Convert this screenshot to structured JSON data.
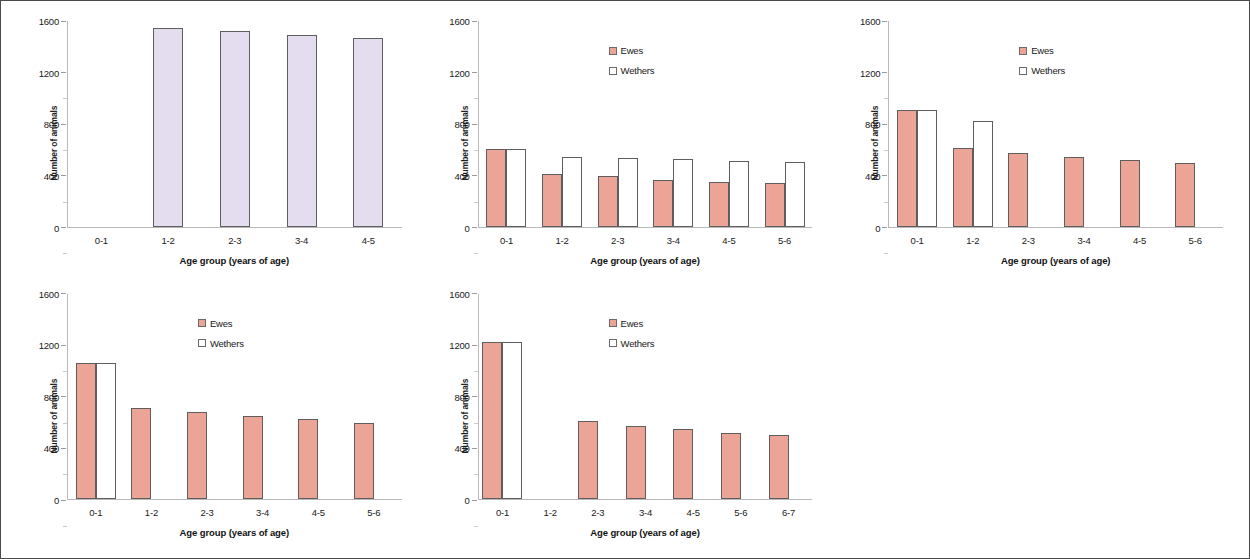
{
  "figure": {
    "panel_count": 5,
    "border_color": "#4a4a4a",
    "background": "#ffffff"
  },
  "colors": {
    "ewes_fill": "#eba496",
    "wethers_fill": "#ffffff",
    "lavender_fill": "#e4ddef",
    "bar_border": "#5e5e5e",
    "axis": "#b9b9b9"
  },
  "labels": {
    "ylabel": "Number of animals",
    "xlabel": "Age group (years of age)",
    "legend_ewes": "Ewes",
    "legend_wethers": "Wethers",
    "yticks": [
      "0",
      "400",
      "800",
      "1200",
      "1600"
    ]
  },
  "chart_data": [
    {
      "type": "bar",
      "panel": 1,
      "title": "",
      "xlabel": "Age group (years of age)",
      "ylabel": "Number of animals",
      "ylim": [
        0,
        1600
      ],
      "ytick_values": [
        0,
        400,
        800,
        1200,
        1600
      ],
      "grid": false,
      "legend": false,
      "categories": [
        "0-1",
        "1-2",
        "2-3",
        "3-4",
        "4-5"
      ],
      "series": [
        {
          "name": "Animals",
          "color": "#e4ddef",
          "values": [
            0,
            1545,
            1520,
            1495,
            1465
          ]
        }
      ]
    },
    {
      "type": "bar",
      "panel": 2,
      "title": "",
      "xlabel": "Age group (years of age)",
      "ylabel": "Number of animals",
      "ylim": [
        0,
        1600
      ],
      "ytick_values": [
        0,
        400,
        800,
        1200,
        1600
      ],
      "grid": false,
      "legend": true,
      "legend_position": "upper-center",
      "categories": [
        "0-1",
        "1-2",
        "2-3",
        "3-4",
        "4-5",
        "5-6"
      ],
      "series": [
        {
          "name": "Ewes",
          "color": "#eba496",
          "values": [
            605,
            410,
            390,
            365,
            350,
            335
          ]
        },
        {
          "name": "Wethers",
          "color": "#ffffff",
          "values": [
            605,
            540,
            535,
            525,
            510,
            505
          ]
        }
      ]
    },
    {
      "type": "bar",
      "panel": 3,
      "title": "",
      "xlabel": "Age group (years of age)",
      "ylabel": "Number of animals",
      "ylim": [
        0,
        1600
      ],
      "ytick_values": [
        0,
        400,
        800,
        1200,
        1600
      ],
      "grid": false,
      "legend": true,
      "legend_position": "upper-center",
      "categories": [
        "0-1",
        "1-2",
        "2-3",
        "3-4",
        "4-5",
        "5-6"
      ],
      "series": [
        {
          "name": "Ewes",
          "color": "#eba496",
          "values": [
            905,
            610,
            575,
            545,
            520,
            495
          ]
        },
        {
          "name": "Wethers",
          "color": "#ffffff",
          "values": [
            905,
            820,
            0,
            0,
            0,
            0
          ]
        }
      ]
    },
    {
      "type": "bar",
      "panel": 4,
      "title": "",
      "xlabel": "Age group (years of age)",
      "ylabel": "Number of animals",
      "ylim": [
        0,
        1600
      ],
      "ytick_values": [
        0,
        400,
        800,
        1200,
        1600
      ],
      "grid": false,
      "legend": true,
      "legend_position": "upper-center",
      "categories": [
        "0-1",
        "1-2",
        "2-3",
        "3-4",
        "4-5",
        "5-6"
      ],
      "series": [
        {
          "name": "Ewes",
          "color": "#eba496",
          "values": [
            1060,
            710,
            680,
            645,
            620,
            590
          ]
        },
        {
          "name": "Wethers",
          "color": "#ffffff",
          "values": [
            1060,
            0,
            0,
            0,
            0,
            0
          ]
        }
      ]
    },
    {
      "type": "bar",
      "panel": 5,
      "title": "",
      "xlabel": "Age group (years of age)",
      "ylabel": "Number of animals",
      "ylim": [
        0,
        1600
      ],
      "ytick_values": [
        0,
        400,
        800,
        1200,
        1600
      ],
      "grid": false,
      "legend": true,
      "legend_position": "upper-center",
      "categories": [
        "0-1",
        "1-2",
        "2-3",
        "3-4",
        "4-5",
        "5-6",
        "6-7"
      ],
      "series": [
        {
          "name": "Ewes",
          "color": "#eba496",
          "values": [
            1225,
            0,
            605,
            570,
            545,
            515,
            495
          ]
        },
        {
          "name": "Wethers",
          "color": "#ffffff",
          "values": [
            1225,
            0,
            0,
            0,
            0,
            0,
            0
          ]
        }
      ]
    }
  ]
}
